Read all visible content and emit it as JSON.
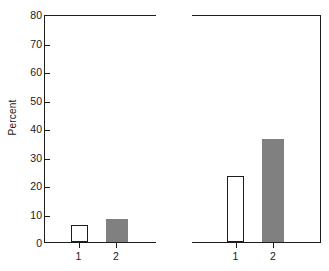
{
  "chart_data": {
    "type": "bar",
    "title": "",
    "xlabel": "",
    "ylabel": "Percent",
    "ylim": [
      0,
      80
    ],
    "yticks": [
      0,
      10,
      20,
      30,
      40,
      50,
      60,
      70,
      80
    ],
    "ytick_labels": [
      "0",
      "10",
      "20",
      "30",
      "40",
      "50",
      "60",
      "70",
      "80"
    ],
    "grid": false,
    "legend": "none",
    "panels": [
      {
        "name": "left-panel",
        "categories": [
          "1",
          "2"
        ],
        "values": [
          6,
          8
        ],
        "bar_styles": [
          "open",
          "filled"
        ]
      },
      {
        "name": "right-panel",
        "categories": [
          "1",
          "2"
        ],
        "values": [
          23,
          36
        ],
        "bar_styles": [
          "open",
          "filled"
        ]
      }
    ],
    "colors": {
      "open_bar_fill": "#ffffff",
      "open_bar_edge": "#1d1d1d",
      "filled_bar": "#808080",
      "axis": "#1d1d1d",
      "text": "#1a1a1a",
      "background": "#ffffff"
    }
  }
}
